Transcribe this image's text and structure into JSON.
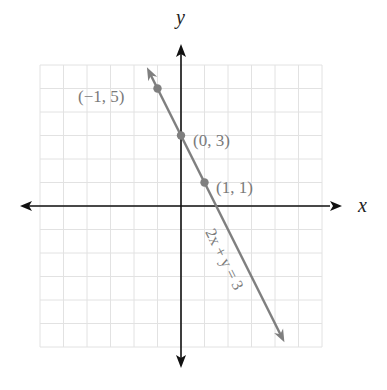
{
  "chart_data": {
    "type": "line",
    "title": "",
    "xlabel": "x",
    "ylabel": "y",
    "xlim": [
      -6,
      6
    ],
    "ylim": [
      -6,
      6
    ],
    "grid": true,
    "series": [
      {
        "name": "2x + y = 3",
        "equation": "2x + y = 3",
        "slope": -2,
        "intercept": 3,
        "extent": {
          "x_start": -1.45,
          "y_start": 5.9,
          "x_end": 4.4,
          "y_end": -5.8
        },
        "points": [
          {
            "x": -1,
            "y": 5,
            "label": "(−1, 5)"
          },
          {
            "x": 0,
            "y": 3,
            "label": "(0, 3)"
          },
          {
            "x": 1,
            "y": 1,
            "label": "(1, 1)"
          }
        ],
        "color": "#7f7f7f"
      }
    ],
    "annotations": [
      "2x + y = 3"
    ]
  },
  "axes": {
    "x_label": "x",
    "y_label": "y",
    "color": "#111111",
    "grid_color": "#e2e2e2"
  },
  "labels": {
    "point1": "(−1, 5)",
    "point2": "(0, 3)",
    "point3": "(1, 1)",
    "equation": "2x + y = 3"
  }
}
